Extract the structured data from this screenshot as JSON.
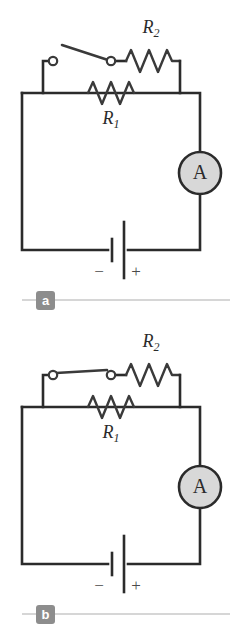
{
  "figure": {
    "colors": {
      "wire": "#2b2b2b",
      "meter_fill": "#d8d8d8",
      "badge": "#8d8d8d",
      "rule": "#d6d6d6",
      "background": "#ffffff"
    }
  },
  "panels": [
    {
      "id": "a",
      "caption": "a",
      "switch_state": "open",
      "components": {
        "resistor_top": {
          "label": "R",
          "subscript": "2",
          "full": "R2"
        },
        "resistor_middle": {
          "label": "R",
          "subscript": "1",
          "full": "R1"
        },
        "ammeter": {
          "label": "A"
        },
        "battery": {
          "negative": "−",
          "positive": "+"
        },
        "switch": {
          "name": "switch",
          "state": "open"
        }
      }
    },
    {
      "id": "b",
      "caption": "b",
      "switch_state": "closed",
      "components": {
        "resistor_top": {
          "label": "R",
          "subscript": "2",
          "full": "R2"
        },
        "resistor_middle": {
          "label": "R",
          "subscript": "1",
          "full": "R1"
        },
        "ammeter": {
          "label": "A"
        },
        "battery": {
          "negative": "−",
          "positive": "+"
        },
        "switch": {
          "name": "switch",
          "state": "closed"
        }
      }
    }
  ]
}
